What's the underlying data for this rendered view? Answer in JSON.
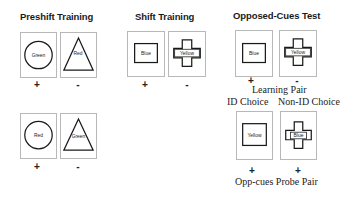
{
  "sections": {
    "preshift": {
      "title": "Preshift Training",
      "rows": [
        {
          "pair": [
            {
              "shape": "circle",
              "label": "Green",
              "sign": "+"
            },
            {
              "shape": "triangle",
              "label": "Red",
              "sign": "-"
            }
          ]
        },
        {
          "pair": [
            {
              "shape": "circle",
              "label": "Red",
              "sign": "+"
            },
            {
              "shape": "triangle",
              "label": "Green",
              "sign": "-"
            }
          ]
        }
      ]
    },
    "shift": {
      "title": "Shift Training",
      "pair": [
        {
          "shape": "square",
          "label": "Blue",
          "sign": "+"
        },
        {
          "shape": "cross",
          "label": "Yellow",
          "sign": "-"
        }
      ]
    },
    "opposed": {
      "title": "Opposed-Cues Test",
      "learning_pair": {
        "caption": "Learning Pair",
        "pair": [
          {
            "shape": "square",
            "label": "Blue",
            "sign": "+"
          },
          {
            "shape": "cross",
            "label": "Yellow",
            "sign": "-"
          }
        ]
      },
      "choice_headers": {
        "id": "ID Choice",
        "non_id": "Non-ID Choice"
      },
      "probe_pair": {
        "caption": "Opp-cues Probe Pair",
        "pair": [
          {
            "shape": "square",
            "label": "Yellow",
            "sign": "+"
          },
          {
            "shape": "cross",
            "label": "Blue",
            "sign": "+"
          }
        ]
      }
    }
  },
  "colors": {
    "card_border": "#b8b8b8",
    "shape_stroke": "#1a1a1a",
    "text": "#222222"
  }
}
